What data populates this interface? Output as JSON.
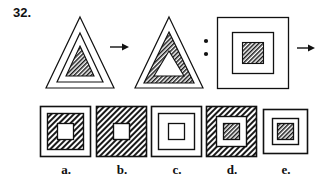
{
  "question": {
    "number_label": "32.",
    "type": "visual-analogy",
    "relation_operator": "arrow-right",
    "analogy_separator": ":",
    "answer_operator": "arrow-right"
  },
  "colors": {
    "ink": "#111111",
    "paper": "#ffffff",
    "hatch": "#1a1a1a"
  },
  "stimulus": {
    "pair_a": {
      "figure_1": {
        "name": "triangle-3-nested-inner-hatched",
        "shape": "triangle",
        "rings": [
          "white",
          "white",
          "hatched"
        ]
      },
      "arrow": "→",
      "figure_2": {
        "name": "triangle-3-nested-middle-hatched",
        "shape": "triangle",
        "rings": [
          "white",
          "hatched",
          "white"
        ]
      }
    },
    "separator": ":",
    "pair_b": {
      "figure_3": {
        "name": "square-3-nested-inner-hatched",
        "shape": "square",
        "rings": [
          "white",
          "white",
          "hatched"
        ]
      },
      "arrow": "→",
      "figure_4": {
        "name": "unknown-answer",
        "shape": "square",
        "rings": []
      }
    }
  },
  "options": [
    {
      "key": "a",
      "label": "a.",
      "shape": "square",
      "rings": [
        "white",
        "hatched",
        "white"
      ],
      "size": "regular"
    },
    {
      "key": "b",
      "label": "b.",
      "shape": "square",
      "rings": [
        "hatched",
        "hatched",
        "white"
      ],
      "size": "regular"
    },
    {
      "key": "c",
      "label": "c.",
      "shape": "square",
      "rings": [
        "white",
        "white",
        "white"
      ],
      "size": "regular"
    },
    {
      "key": "d",
      "label": "d.",
      "shape": "square",
      "rings": [
        "hatched",
        "white",
        "hatched"
      ],
      "size": "regular"
    },
    {
      "key": "e",
      "label": "e.",
      "shape": "square",
      "rings": [
        "white",
        "white",
        "hatched"
      ],
      "size": "small"
    }
  ]
}
